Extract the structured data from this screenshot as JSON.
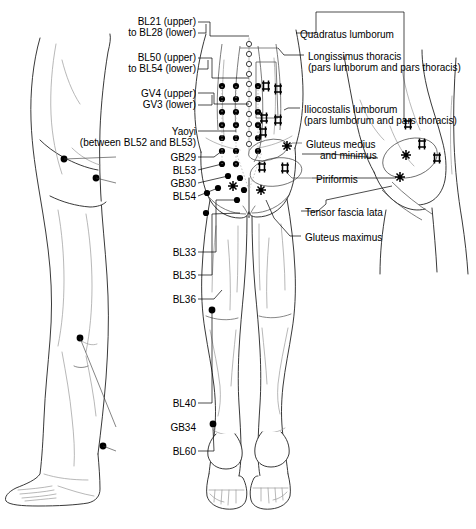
{
  "diagram": {
    "views": [
      {
        "name": "lateral-view-left",
        "description": "Left lateral (side) view of trunk, hip and leg"
      },
      {
        "name": "posterior-view-center",
        "description": "Posterior (back) view of low back, buttocks and both legs"
      },
      {
        "name": "lateral-view-right",
        "description": "Right lateral view of hip and buttock showing trigger points"
      }
    ]
  },
  "acupoint_labels": [
    {
      "id": "bl21-bl28",
      "line1": "BL21 (upper)",
      "line2": "to BL28 (lower)",
      "x": 112,
      "y": 16,
      "align": "right",
      "width": 84
    },
    {
      "id": "bl50-bl54",
      "line1": "BL50 (upper)",
      "line2": "to BL54 (lower)",
      "x": 112,
      "y": 52,
      "align": "right",
      "width": 84
    },
    {
      "id": "gv4-gv3",
      "line1": "GV4 (upper)",
      "line2": "GV3 (lower)",
      "x": 112,
      "y": 88,
      "align": "right",
      "width": 84
    },
    {
      "id": "yaoyi",
      "line1": "Yaoyi",
      "line2": "(between BL52 and BL53)",
      "x": 60,
      "y": 126,
      "align": "right",
      "width": 136,
      "italic": true
    },
    {
      "id": "gb29",
      "line1": "GB29",
      "x": 130,
      "y": 152,
      "align": "right",
      "width": 66
    },
    {
      "id": "bl53",
      "line1": "BL53",
      "x": 130,
      "y": 165,
      "align": "right",
      "width": 66
    },
    {
      "id": "gb30",
      "line1": "GB30",
      "x": 130,
      "y": 178,
      "align": "right",
      "width": 66
    },
    {
      "id": "bl54",
      "line1": "BL54",
      "x": 130,
      "y": 191,
      "align": "right",
      "width": 66
    },
    {
      "id": "bl33",
      "line1": "BL33",
      "x": 130,
      "y": 247,
      "align": "right",
      "width": 66
    },
    {
      "id": "bl35",
      "line1": "BL35",
      "x": 130,
      "y": 270,
      "align": "right",
      "width": 66
    },
    {
      "id": "bl36",
      "line1": "BL36",
      "x": 130,
      "y": 294,
      "align": "right",
      "width": 66
    },
    {
      "id": "bl40",
      "line1": "BL40",
      "x": 130,
      "y": 398,
      "align": "right",
      "width": 66
    },
    {
      "id": "gb34",
      "line1": "GB34",
      "x": 130,
      "y": 422,
      "align": "right",
      "width": 66
    },
    {
      "id": "bl60",
      "line1": "BL60",
      "x": 130,
      "y": 446,
      "align": "right",
      "width": 66
    }
  ],
  "muscle_labels": [
    {
      "id": "quadratus-lumborum",
      "line1": "Quadratus lumborum",
      "x": 300,
      "y": 29,
      "align": "left"
    },
    {
      "id": "longissimus-thoracis",
      "line1": "Longissimus thoracis",
      "sub": "(pars lumborum and pars thoracis)",
      "x": 308,
      "y": 51,
      "align": "left"
    },
    {
      "id": "iliocostalis-lumborum",
      "line1": "Iliocostalis lumborum",
      "sub": "(pars lumborum and pars thoracis)",
      "x": 304,
      "y": 104,
      "align": "left"
    },
    {
      "id": "gluteus-medius-minimus",
      "line1": "Gluteus medius",
      "line2": "and minimus",
      "x": 306,
      "y": 139,
      "align": "left"
    },
    {
      "id": "piriformis",
      "line1": "Piriformis",
      "x": 316,
      "y": 174,
      "align": "left"
    },
    {
      "id": "tensor-fascia-lata",
      "line1": "Tensor fascia lata",
      "x": 305,
      "y": 207,
      "align": "left"
    },
    {
      "id": "gluteus-maximus",
      "line1": "Gluteus maximus",
      "x": 305,
      "y": 232,
      "align": "left"
    }
  ],
  "colors": {
    "ink": "#000000",
    "outline": "#222222",
    "detail": "#9a9a9a",
    "muscle": "#444444",
    "background": "#ffffff"
  }
}
